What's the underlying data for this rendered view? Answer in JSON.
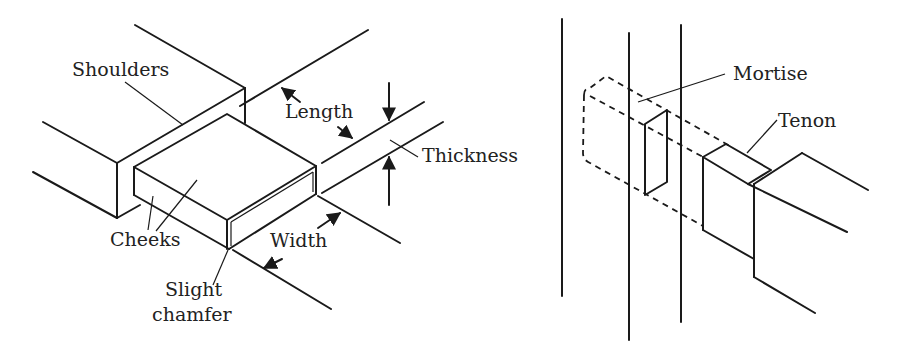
{
  "figure": {
    "left_panel": {
      "title": "Tenon anatomy",
      "labels": {
        "shoulders": "Shoulders",
        "length": "Length",
        "thickness": "Thickness",
        "cheeks": "Cheeks",
        "width": "Width",
        "chamfer_line1": "Slight",
        "chamfer_line2": "chamfer"
      }
    },
    "right_panel": {
      "title": "Mortise and tenon joint",
      "labels": {
        "mortise": "Mortise",
        "tenon": "Tenon"
      }
    },
    "colors": {
      "line": "#1a1a1a",
      "text": "#222222",
      "background": "#ffffff"
    }
  }
}
